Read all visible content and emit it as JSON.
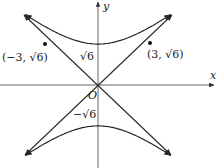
{
  "diagram": {
    "type": "hyperbola",
    "equation": "y^2/6 - x^2/9 = 1",
    "asymptotes": [
      "y = (sqrt6/3)x",
      "y = -(sqrt6/3)x"
    ],
    "origin_px": [
      98,
      85
    ],
    "scale_px_per_unit": {
      "x": 17.3,
      "y": 16.7
    },
    "colors": {
      "curve": "#2a2a2a",
      "axis": "#555555",
      "text": "#222222"
    }
  },
  "labels": {
    "x_axis": "x",
    "y_axis": "y",
    "origin": "O",
    "upper_vertex": "√6",
    "lower_vertex": "−√6",
    "point_left": "(−3, √6)",
    "point_right": "(3, √6)"
  },
  "points": [
    {
      "name": "point-left",
      "x": -3,
      "y": 2.449,
      "label": "(−3, √6)"
    },
    {
      "name": "point-right",
      "x": 3,
      "y": 2.449,
      "label": "(3, √6)"
    }
  ]
}
